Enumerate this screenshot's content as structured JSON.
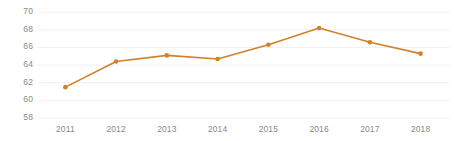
{
  "chart_data": {
    "type": "line",
    "title": "",
    "subtitle": "",
    "xlabel": "",
    "ylabel": "",
    "categories": [
      "2011",
      "2012",
      "2013",
      "2014",
      "2015",
      "2016",
      "2017",
      "2018"
    ],
    "values": [
      61.5,
      64.4,
      65.1,
      64.7,
      66.3,
      68.2,
      66.6,
      65.3
    ],
    "series": [
      {
        "name": "",
        "values": [
          61.5,
          64.4,
          65.1,
          64.7,
          66.3,
          68.2,
          66.6,
          65.3
        ],
        "color": "#D2802A"
      }
    ],
    "ylim": [
      58,
      70
    ],
    "yticks": [
      58,
      60,
      62,
      64,
      66,
      68,
      70
    ],
    "ytick_labels": [
      "58",
      "60",
      "62",
      "64",
      "66",
      "68",
      "70"
    ],
    "xtick_labels": [
      "2011",
      "2012",
      "2013",
      "2014",
      "2015",
      "2016",
      "2017",
      "2018"
    ],
    "grid": true,
    "grid_color": "#F0F0F0",
    "legend": false,
    "legend_position": "none",
    "marker": "circle",
    "line_width": 1.6,
    "background": "#FFFFFF",
    "axis_text_color": "#8A8A8A"
  }
}
